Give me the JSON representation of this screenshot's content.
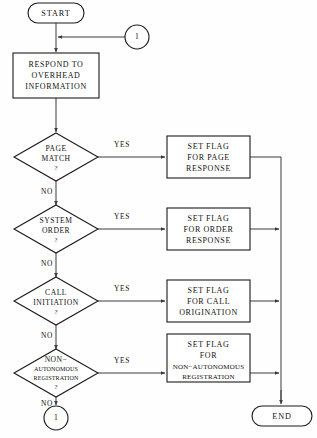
{
  "diagram": {
    "type": "flowchart",
    "orientation": "top-to-bottom",
    "nodes": {
      "start": {
        "label": "START",
        "shape": "terminator"
      },
      "connector_in": {
        "label": "1",
        "shape": "connector"
      },
      "respond": {
        "shape": "process",
        "lines": [
          "RESPOND TO",
          "OVERHEAD",
          "INFORMATION"
        ]
      },
      "page_match": {
        "shape": "decision",
        "lines": [
          "PAGE",
          "MATCH"
        ],
        "question": "?"
      },
      "system_order": {
        "shape": "decision",
        "lines": [
          "SYSTEM",
          "ORDER"
        ],
        "question": "?"
      },
      "call_initiation": {
        "shape": "decision",
        "lines": [
          "CALL",
          "INITIATION"
        ],
        "question": "?"
      },
      "non_autonomous": {
        "shape": "decision",
        "lines": [
          "NON−",
          "AUTONOMOUS",
          "REGISTRATION"
        ],
        "question": "?"
      },
      "flag_page": {
        "shape": "process",
        "lines": [
          "SET FLAG",
          "FOR PAGE",
          "RESPONSE"
        ]
      },
      "flag_order": {
        "shape": "process",
        "lines": [
          "SET FLAG",
          "FOR ORDER",
          "RESPONSE"
        ]
      },
      "flag_call": {
        "shape": "process",
        "lines": [
          "SET FLAG",
          "FOR CALL",
          "ORIGINATION"
        ]
      },
      "flag_nonauto": {
        "shape": "process",
        "lines": [
          "SET FLAG",
          "FOR",
          "NON−AUTONOMOUS",
          "REGISTRATION"
        ]
      },
      "connector_out": {
        "label": "1",
        "shape": "connector"
      },
      "end": {
        "label": "END",
        "shape": "terminator"
      }
    },
    "edge_labels": {
      "yes": "YES",
      "no": "NO"
    },
    "edges": [
      {
        "from": "start",
        "to": "respond",
        "label": ""
      },
      {
        "from": "connector_in",
        "to": "respond",
        "label": ""
      },
      {
        "from": "respond",
        "to": "page_match",
        "label": ""
      },
      {
        "from": "page_match",
        "to": "flag_page",
        "label": "YES"
      },
      {
        "from": "page_match",
        "to": "system_order",
        "label": "NO"
      },
      {
        "from": "system_order",
        "to": "flag_order",
        "label": "YES"
      },
      {
        "from": "system_order",
        "to": "call_initiation",
        "label": "NO"
      },
      {
        "from": "call_initiation",
        "to": "flag_call",
        "label": "YES"
      },
      {
        "from": "call_initiation",
        "to": "non_autonomous",
        "label": "NO"
      },
      {
        "from": "non_autonomous",
        "to": "flag_nonauto",
        "label": "YES"
      },
      {
        "from": "non_autonomous",
        "to": "connector_out",
        "label": "NO"
      },
      {
        "from": "flag_page",
        "to": "end",
        "label": ""
      },
      {
        "from": "flag_order",
        "to": "end",
        "label": ""
      },
      {
        "from": "flag_call",
        "to": "end",
        "label": ""
      },
      {
        "from": "flag_nonauto",
        "to": "end",
        "label": ""
      }
    ],
    "colors": {
      "stroke": "#1a1a1a",
      "connector_line": "#3a3a3a",
      "fill": "#ffffff",
      "background": "#fefefe",
      "text": "#111111"
    }
  }
}
